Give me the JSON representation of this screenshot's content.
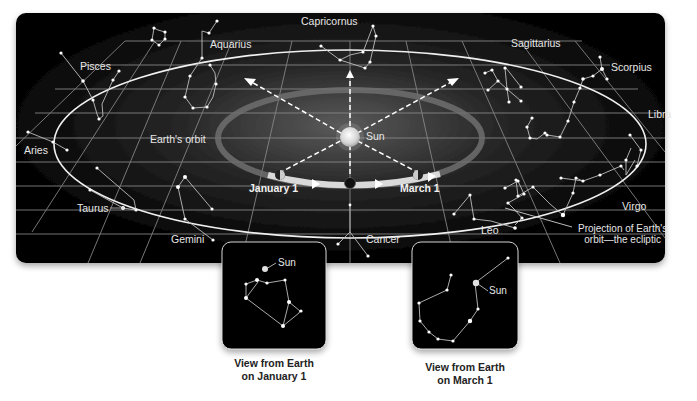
{
  "diagram": {
    "colors": {
      "panel_bg": "#000000",
      "grid": "#8c8c8c",
      "orbit_ring": "#e8e8e8",
      "sun": "#d8d8d8",
      "text_light": "#e6e6e6",
      "caption_text": "#222222"
    },
    "constellations": {
      "capricornus": "Capricornus",
      "aquarius": "Aquarius",
      "pisces": "Pisces",
      "sagittarius": "Sagittarius",
      "scorpius": "Scorpius",
      "libra": "Libra",
      "aries": "Aries",
      "taurus": "Taurus",
      "gemini": "Gemini",
      "cancer": "Cancer",
      "leo": "Leo",
      "virgo": "Virgo"
    },
    "labels": {
      "earths_orbit": "Earth's orbit",
      "sun": "Sun",
      "january_1": "January 1",
      "march_1": "March 1",
      "ecliptic_line1": "Projection of Earth's",
      "ecliptic_line2": "orbit—the ecliptic"
    },
    "insets": [
      {
        "sun_label": "Sun",
        "caption_line1": "View from Earth",
        "caption_line2": "on January 1"
      },
      {
        "sun_label": "Sun",
        "caption_line1": "View from Earth",
        "caption_line2": "on March 1"
      }
    ]
  }
}
